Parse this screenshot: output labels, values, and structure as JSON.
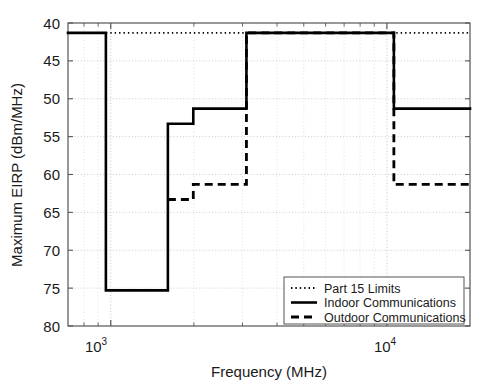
{
  "chart_data": {
    "type": "line",
    "title": "",
    "xlabel": "Frequency  (MHz)",
    "ylabel": "Maximum EIRP (dBm/MHz)",
    "xscale": "log",
    "xlim": [
      700,
      20000
    ],
    "ylim": [
      -80,
      -40
    ],
    "y_axis_inverted": true,
    "grid": true,
    "grid_style": "dotted",
    "xticks": [
      1000,
      10000
    ],
    "xtick_labels": [
      "10^3",
      "10^4"
    ],
    "yticks": [
      -40,
      -45,
      -50,
      -55,
      -60,
      -65,
      -70,
      -75,
      -80
    ],
    "ytick_labels": [
      "40",
      "45",
      "50",
      "55",
      "60",
      "65",
      "70",
      "75",
      "80"
    ],
    "legend_position": "lower right",
    "series": [
      {
        "name": "Part 15 Limits",
        "style": "dotted",
        "color": "#000000",
        "steps": [
          {
            "f_start": 960,
            "f_end": 20000,
            "eirp": -41.3
          }
        ]
      },
      {
        "name": "Indoor Communications",
        "style": "solid",
        "color": "#000000",
        "steps": [
          {
            "f_start": 700,
            "f_end": 960,
            "eirp": -41.3
          },
          {
            "f_start": 960,
            "f_end": 1610,
            "eirp": -75.3
          },
          {
            "f_start": 1610,
            "f_end": 1990,
            "eirp": -53.3
          },
          {
            "f_start": 1990,
            "f_end": 3100,
            "eirp": -51.3
          },
          {
            "f_start": 3100,
            "f_end": 10600,
            "eirp": -41.3
          },
          {
            "f_start": 10600,
            "f_end": 20000,
            "eirp": -51.3
          }
        ]
      },
      {
        "name": "Outdoor Communications",
        "style": "dashed",
        "color": "#000000",
        "steps": [
          {
            "f_start": 1610,
            "f_end": 1990,
            "eirp": -63.3
          },
          {
            "f_start": 1990,
            "f_end": 3100,
            "eirp": -61.3
          },
          {
            "f_start": 3100,
            "f_end": 10600,
            "eirp": -41.3
          },
          {
            "f_start": 10600,
            "f_end": 20000,
            "eirp": -61.3
          }
        ]
      }
    ]
  },
  "axes": {
    "x_title": "Frequency  (MHz)",
    "y_title": "Maximum EIRP (dBm/MHz)",
    "x_tick_1_base": "10",
    "x_tick_1_exp": "3",
    "x_tick_2_base": "10",
    "x_tick_2_exp": "4",
    "y_tick_0": "40",
    "y_tick_1": "45",
    "y_tick_2": "50",
    "y_tick_3": "55",
    "y_tick_4": "60",
    "y_tick_5": "65",
    "y_tick_6": "70",
    "y_tick_7": "75",
    "y_tick_8": "80"
  },
  "legend": {
    "entries": [
      {
        "label": "Part 15 Limits",
        "style": "dotted"
      },
      {
        "label": "Indoor Communications",
        "style": "solid"
      },
      {
        "label": "Outdoor Communications",
        "style": "dashed"
      }
    ]
  },
  "colors": {
    "line": "#000000",
    "grid": "#bdbdbd",
    "axis": "#555555",
    "background": "#ffffff"
  }
}
